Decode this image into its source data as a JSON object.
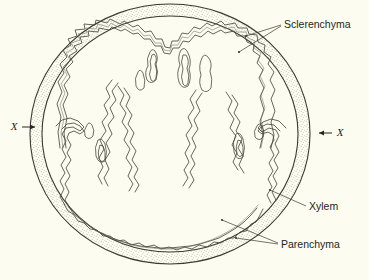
{
  "figure": {
    "type": "botanical-line-diagram",
    "background_color": "#fcfcf0",
    "ink_color": "#3a3a32",
    "stipple_color": "#8d8d7e"
  },
  "labels": {
    "sclerenchyma": "Sclerenchyma",
    "xylem": "Xylem",
    "parenchyma": "Parenchyma"
  },
  "section_markers": {
    "left": "X",
    "right": "X"
  },
  "caption": {
    "text": ""
  }
}
